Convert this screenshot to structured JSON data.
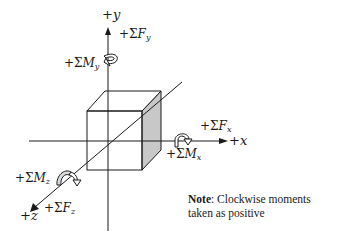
{
  "diagram": {
    "axes": {
      "x": {
        "label_sign": "+",
        "label_var": "x"
      },
      "y": {
        "label_sign": "+",
        "label_var": "y"
      },
      "z": {
        "label_sign": "+",
        "label_var": "z"
      }
    },
    "forces": {
      "x": {
        "prefix": "+Σ",
        "symbol": "F",
        "sub": "x"
      },
      "y": {
        "prefix": "+Σ",
        "symbol": "F",
        "sub": "y"
      },
      "z": {
        "prefix": "+Σ",
        "symbol": "F",
        "sub": "z"
      }
    },
    "moments": {
      "x": {
        "prefix": "+Σ",
        "symbol": "M",
        "sub": "x"
      },
      "y": {
        "prefix": "+Σ",
        "symbol": "M",
        "sub": "y"
      },
      "z": {
        "prefix": "+Σ",
        "symbol": "M",
        "sub": "z"
      }
    },
    "note": {
      "title": "Note",
      "line1": ": Clockwise moments",
      "line2": "taken as positive"
    },
    "icons": [
      "curved-arrow-icon-y",
      "curved-arrow-icon-x",
      "curved-arrow-icon-z",
      "arrowhead-icon-x",
      "arrowhead-icon-y",
      "arrowhead-icon-z"
    ],
    "colors": {
      "line": "#1a1a1a",
      "shaded_face": "#c8c8c8",
      "background": "#ffffff"
    }
  }
}
